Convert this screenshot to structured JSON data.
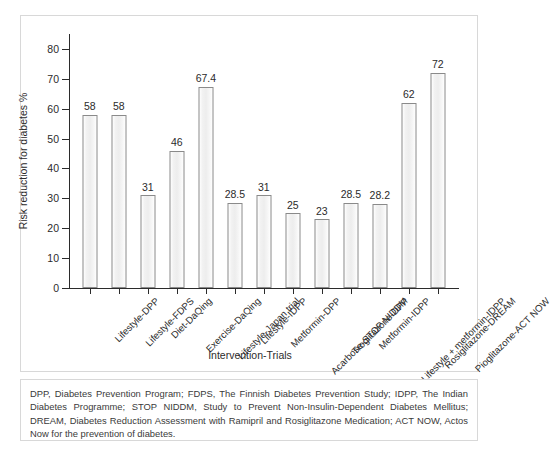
{
  "chart_data": {
    "type": "bar",
    "title": "",
    "subtitle": "",
    "xlabel": "Intervention-Trials",
    "ylabel": "Risk reduction for diabetes %",
    "ylim": [
      0,
      85
    ],
    "yticks": [
      0,
      10,
      20,
      30,
      40,
      50,
      60,
      70,
      80
    ],
    "grid": false,
    "legend": "none",
    "categories": [
      "Lifestyle-DPP",
      "Lifestyle-FDPS",
      "Diet-DaQing",
      "Exercise-DaQing",
      "Lifestyle-Japan trial",
      "Lifestyle-IDPP",
      "Metformin-DPP",
      "Acarbose-STOP NIDDM",
      "Troglitazone-DPP",
      "Metformin-IDPP",
      "Lifestyle + metformin-IDPP",
      "Rosiglitazone-DREAM",
      "Pioglitazone-ACT NOW"
    ],
    "values": [
      58,
      58,
      31,
      46,
      67.4,
      28.5,
      31,
      25,
      23,
      28.5,
      28.2,
      62,
      72
    ],
    "value_labels": [
      "58",
      "58",
      "31",
      "46",
      "67.4",
      "28.5",
      "31",
      "25",
      "23",
      "28.5",
      "28.2",
      "62",
      "72"
    ]
  },
  "footnote": {
    "text": "DPP, Diabetes Prevention Program; FDPS, The Finnish Diabetes Prevention Study; IDPP, The Indian Diabetes Programme; STOP NIDDM, Study to Prevent Non-Insulin-Dependent Diabetes Mellitus; DREAM, Diabetes Reduction Assessment with Ramipril and Rosiglitazone Medication; ACT NOW, Actos Now for the prevention of diabetes."
  },
  "style": {
    "bar_fill": "#f0f0f0",
    "bar_stroke": "#8a8a8a",
    "axis_color": "#2b2b2b",
    "frame_color": "#d8d8d8",
    "background": "#ffffff"
  }
}
